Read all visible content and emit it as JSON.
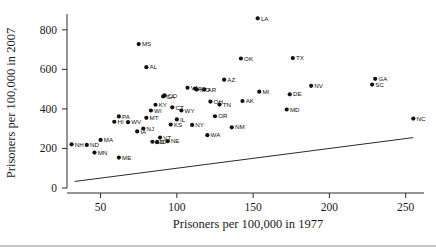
{
  "chart_data": {
    "type": "scatter",
    "title": "",
    "xlabel": "Prisoners per 100,000 in 1977",
    "ylabel": "Prisoners per 100,000 in 2007",
    "xlim": [
      28,
      262
    ],
    "ylim": [
      0,
      880
    ],
    "xticks": [
      50,
      100,
      150,
      200,
      250
    ],
    "yticks": [
      0,
      200,
      400,
      600,
      800
    ],
    "grid": false,
    "legend": null,
    "annotations": [
      {
        "type": "reference-line",
        "description": "y = x diagonal line",
        "x_start": 33,
        "y_start": 33,
        "x_end": 255,
        "y_end": 255
      }
    ],
    "point_label_position": "right",
    "points": [
      {
        "label": "LA",
        "x": 153,
        "y": 858
      },
      {
        "label": "MS",
        "x": 75,
        "y": 728
      },
      {
        "label": "OK",
        "x": 142,
        "y": 655
      },
      {
        "label": "TX",
        "x": 176,
        "y": 657
      },
      {
        "label": "AL",
        "x": 80,
        "y": 611
      },
      {
        "label": "AZ",
        "x": 131,
        "y": 548
      },
      {
        "label": "GA",
        "x": 230,
        "y": 552
      },
      {
        "label": "SC",
        "x": 228,
        "y": 523
      },
      {
        "label": "NV",
        "x": 188,
        "y": 517
      },
      {
        "label": "MI",
        "x": 154,
        "y": 487
      },
      {
        "label": "AR",
        "x": 118,
        "y": 499
      },
      {
        "label": "DE",
        "x": 174,
        "y": 474
      },
      {
        "label": "FL",
        "x": 112,
        "y": 502
      },
      {
        "label": "VA",
        "x": 107,
        "y": 507
      },
      {
        "label": "MO",
        "x": 113,
        "y": 498
      },
      {
        "label": "CO",
        "x": 92,
        "y": 468
      },
      {
        "label": "CA",
        "x": 91,
        "y": 463
      },
      {
        "label": "OH",
        "x": 122,
        "y": 437
      },
      {
        "label": "AK",
        "x": 143,
        "y": 440
      },
      {
        "label": "TN",
        "x": 128,
        "y": 422
      },
      {
        "label": "KY",
        "x": 86,
        "y": 421
      },
      {
        "label": "MD",
        "x": 172,
        "y": 397
      },
      {
        "label": "CT",
        "x": 97,
        "y": 408
      },
      {
        "label": "WY",
        "x": 103,
        "y": 392
      },
      {
        "label": "WI",
        "x": 83,
        "y": 392
      },
      {
        "label": "OR",
        "x": 125,
        "y": 363
      },
      {
        "label": "PA",
        "x": 62,
        "y": 362
      },
      {
        "label": "MT",
        "x": 80,
        "y": 355
      },
      {
        "label": "NC",
        "x": 255,
        "y": 351
      },
      {
        "label": "IL",
        "x": 100,
        "y": 347
      },
      {
        "label": "HI",
        "x": 59,
        "y": 335
      },
      {
        "label": "WV",
        "x": 68,
        "y": 333
      },
      {
        "label": "NY",
        "x": 110,
        "y": 319
      },
      {
        "label": "KS",
        "x": 96,
        "y": 321
      },
      {
        "label": "NM",
        "x": 136,
        "y": 307
      },
      {
        "label": "NJ",
        "x": 78,
        "y": 301
      },
      {
        "label": "IA",
        "x": 74,
        "y": 286
      },
      {
        "label": "WA",
        "x": 120,
        "y": 267
      },
      {
        "label": "VT",
        "x": 89,
        "y": 255
      },
      {
        "label": "MA",
        "x": 50,
        "y": 243
      },
      {
        "label": "NE",
        "x": 94,
        "y": 237
      },
      {
        "label": "ID",
        "x": 87,
        "y": 232
      },
      {
        "label": "SD",
        "x": 84,
        "y": 234
      },
      {
        "label": "NH",
        "x": 31,
        "y": 221
      },
      {
        "label": "ND",
        "x": 41,
        "y": 218
      },
      {
        "label": "MN",
        "x": 46,
        "y": 179
      },
      {
        "label": "ME",
        "x": 62,
        "y": 154
      }
    ]
  },
  "axes": {
    "x_title": "Prisoners per 100,000 in 1977",
    "y_title": "Prisoners per 100,000 in 2007",
    "x_tick_labels": [
      "50",
      "100",
      "150",
      "200",
      "250"
    ],
    "y_tick_labels": [
      "0",
      "200",
      "400",
      "600",
      "800"
    ]
  },
  "style": {
    "point_color": "#111111",
    "axis_color": "#2a2a2a",
    "label_color": "#111111",
    "background": "#ffffff",
    "footer_rule_color": "#8a8a8a"
  }
}
